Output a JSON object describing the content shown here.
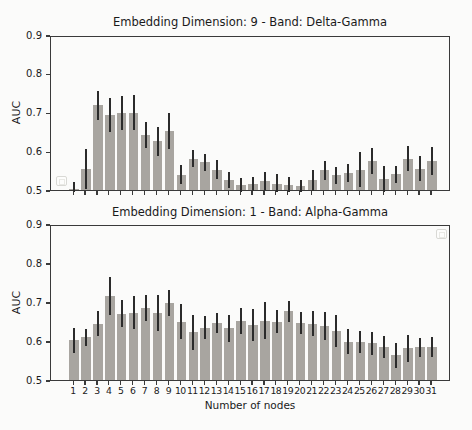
{
  "figure": {
    "background_color": "#fbfbfa",
    "bar_color": "#a8a5a0",
    "error_bar_color": "#2b2b2b",
    "axis_color": "#3a3a3a",
    "text_color": "#1a1a1a"
  },
  "chart_data": [
    {
      "type": "bar",
      "title": "Embedding Dimension: 9 - Band: Delta-Gamma",
      "xlabel": "",
      "ylabel": "AUC",
      "ylim": [
        0.5,
        0.9
      ],
      "yticks": [
        "0.9",
        "0.8",
        "0.7",
        "0.6",
        "0.5"
      ],
      "ytick_values": [
        0.9,
        0.8,
        0.7,
        0.6,
        0.5
      ],
      "grid": false,
      "legend_position": "lower-left",
      "categories": [
        1,
        2,
        3,
        4,
        5,
        6,
        7,
        8,
        9,
        10,
        11,
        12,
        13,
        14,
        15,
        16,
        17,
        18,
        19,
        20,
        21,
        22,
        23,
        24,
        25,
        26,
        27,
        28,
        29,
        30,
        31
      ],
      "values": [
        0.507,
        0.56,
        0.724,
        0.699,
        0.704,
        0.705,
        0.647,
        0.631,
        0.657,
        0.545,
        0.586,
        0.577,
        0.558,
        0.531,
        0.517,
        0.521,
        0.528,
        0.521,
        0.519,
        0.515,
        0.53,
        0.556,
        0.543,
        0.549,
        0.558,
        0.58,
        0.534,
        0.546,
        0.586,
        0.56,
        0.58
      ],
      "errors": [
        0.02,
        0.052,
        0.037,
        0.044,
        0.043,
        0.046,
        0.033,
        0.038,
        0.047,
        0.025,
        0.022,
        0.022,
        0.024,
        0.021,
        0.018,
        0.019,
        0.024,
        0.026,
        0.02,
        0.017,
        0.028,
        0.024,
        0.022,
        0.023,
        0.045,
        0.034,
        0.034,
        0.022,
        0.033,
        0.032,
        0.035
      ]
    },
    {
      "type": "bar",
      "title": "Embedding Dimension: 1 - Band: Alpha-Gamma",
      "xlabel": "Number of nodes",
      "ylabel": "AUC",
      "ylim": [
        0.5,
        0.9
      ],
      "yticks": [
        "0.9",
        "0.8",
        "0.7",
        "0.6",
        "0.5"
      ],
      "ytick_values": [
        0.9,
        0.8,
        0.7,
        0.6,
        0.5
      ],
      "grid": false,
      "legend_position": "upper-right",
      "categories": [
        1,
        2,
        3,
        4,
        5,
        6,
        7,
        8,
        9,
        10,
        11,
        12,
        13,
        14,
        15,
        16,
        17,
        18,
        19,
        20,
        21,
        22,
        23,
        24,
        25,
        26,
        27,
        28,
        29,
        30,
        31
      ],
      "values": [
        0.607,
        0.615,
        0.65,
        0.72,
        0.675,
        0.678,
        0.69,
        0.676,
        0.702,
        0.655,
        0.627,
        0.639,
        0.651,
        0.638,
        0.657,
        0.646,
        0.657,
        0.655,
        0.681,
        0.652,
        0.649,
        0.644,
        0.631,
        0.603,
        0.603,
        0.599,
        0.59,
        0.569,
        0.586,
        0.589,
        0.59
      ],
      "errors": [
        0.032,
        0.022,
        0.033,
        0.048,
        0.035,
        0.042,
        0.033,
        0.046,
        0.034,
        0.045,
        0.044,
        0.03,
        0.026,
        0.035,
        0.033,
        0.042,
        0.048,
        0.03,
        0.027,
        0.028,
        0.032,
        0.036,
        0.041,
        0.032,
        0.028,
        0.03,
        0.028,
        0.032,
        0.034,
        0.024,
        0.026
      ]
    }
  ]
}
